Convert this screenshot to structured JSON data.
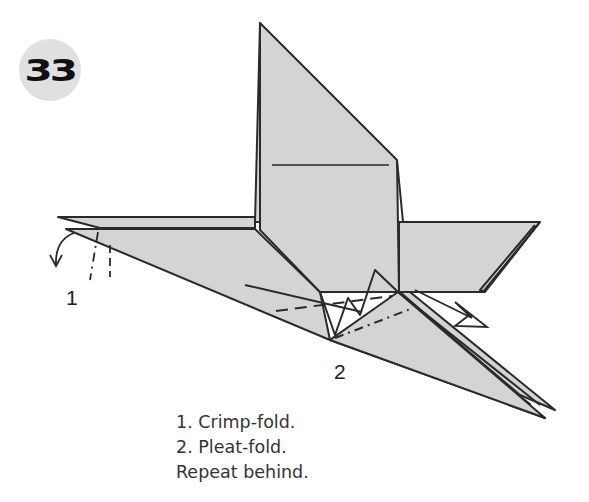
{
  "step": {
    "number": "33"
  },
  "callouts": [
    {
      "id": "1",
      "label": "1"
    },
    {
      "id": "2",
      "label": "2"
    }
  ],
  "instructions": [
    "1. Crimp-fold.",
    "2. Pleat-fold.",
    "Repeat behind."
  ],
  "colors": {
    "paper": "#d4d4d4",
    "line": "#2a2a2a",
    "badge": "#e0e0e0"
  }
}
